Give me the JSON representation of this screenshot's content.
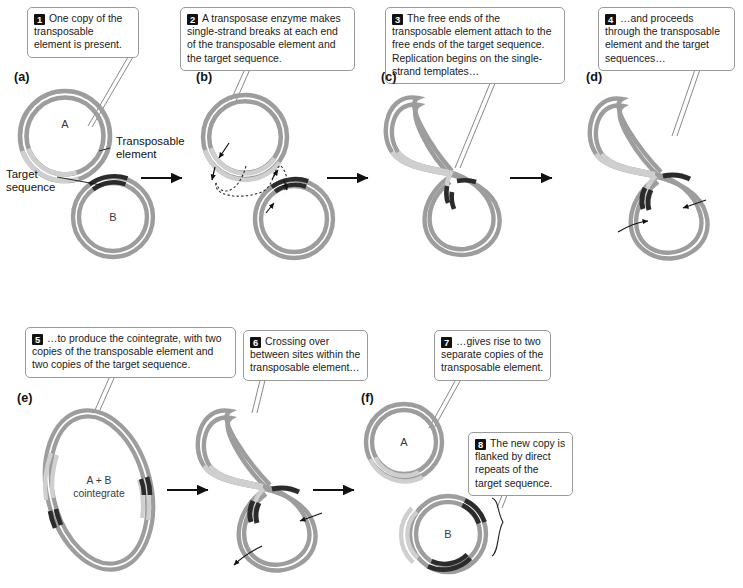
{
  "figure": {
    "colors": {
      "dna_strand": "#9d9d9d",
      "dna_strand_light": "#c9c9c9",
      "transposable_element": "#cfcfcf",
      "target_sequence": "#2b2b2b",
      "callout_number_bg": "#111111",
      "callout_border": "#9a9a9a",
      "text": "#1b1b1b",
      "leader_line": "#7a7a7a"
    }
  },
  "callouts": [
    {
      "id": 1,
      "number": "1",
      "text": "One copy of the transposable element is present."
    },
    {
      "id": 2,
      "number": "2",
      "text": "A transposase enzyme makes single-strand breaks at each end of the transposable element and the target sequence."
    },
    {
      "id": 3,
      "number": "3",
      "text": "The free ends of the transposable element attach to the free ends of the target sequence. Replication begins on the single-strand templates…"
    },
    {
      "id": 4,
      "number": "4",
      "text": "…and proceeds through the transposable element and the target sequences…"
    },
    {
      "id": 5,
      "number": "5",
      "text": "…to produce the cointegrate, with two copies of the transposable element and two copies of the target sequence."
    },
    {
      "id": 6,
      "number": "6",
      "text": "Crossing over between sites within the transposable element…"
    },
    {
      "id": 7,
      "number": "7",
      "text": "…gives rise to two separate copies of the transposable element."
    },
    {
      "id": 8,
      "number": "8",
      "text": "The new copy is flanked by direct repeats of the target sequence."
    }
  ],
  "panels": [
    {
      "id": "a",
      "label": "(a)"
    },
    {
      "id": "b",
      "label": "(b)"
    },
    {
      "id": "c",
      "label": "(c)"
    },
    {
      "id": "d",
      "label": "(d)"
    },
    {
      "id": "e",
      "label": "(e)"
    },
    {
      "id": "f",
      "label": "(f)"
    }
  ],
  "annotations": [
    {
      "id": "transposable-element",
      "line1": "Transposable",
      "line2": "element"
    },
    {
      "id": "target-sequence",
      "line1": "Target",
      "line2": "sequence"
    }
  ],
  "ring_labels": [
    {
      "id": "plasmid-a-top",
      "text": "A"
    },
    {
      "id": "plasmid-b-top",
      "text": "B"
    },
    {
      "id": "cointegrate-line1",
      "text": "A + B"
    },
    {
      "id": "cointegrate-line2",
      "text": "cointegrate"
    },
    {
      "id": "plasmid-a-bottom",
      "text": "A"
    },
    {
      "id": "plasmid-b-bottom",
      "text": "B"
    }
  ]
}
